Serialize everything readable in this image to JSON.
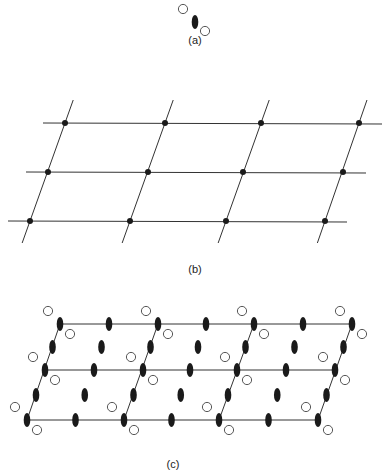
{
  "panels": {
    "a": {
      "label": "(a)",
      "label_pos": [
        195,
        34
      ]
    },
    "b": {
      "label": "(b)",
      "label_pos": [
        195,
        263
      ]
    },
    "c": {
      "label": "(c)",
      "label_pos": [
        173,
        458
      ]
    }
  },
  "colors": {
    "ink": "#1a1a1a",
    "line": "#333333",
    "bg": "#ffffff"
  },
  "motif": {
    "offsets": {
      "circle_ul": [
        -12,
        -13
      ],
      "circle_lr": [
        10,
        10
      ]
    },
    "ellipse_rx": 3.3,
    "ellipse_ry": 7,
    "circle_r": 4.6
  },
  "lattice_b": {
    "rows": [
      {
        "y": 123,
        "xs": [
          65,
          165,
          261,
          359
        ],
        "line": [
          43,
          382
        ]
      },
      {
        "y": 172,
        "xs": [
          48,
          148,
          243,
          343
        ],
        "line": [
          26,
          366
        ]
      },
      {
        "y": 221,
        "xs": [
          30,
          130,
          226,
          325
        ],
        "line": [
          8,
          347
        ]
      }
    ],
    "dot_r": 3
  },
  "lattice_c": {
    "rows": [
      {
        "y": 324,
        "xs": [
          60,
          158,
          254,
          352
        ]
      },
      {
        "y": 370,
        "xs": [
          45,
          143,
          237,
          335
        ]
      },
      {
        "y": 420,
        "xs": [
          27,
          124,
          219,
          318
        ]
      }
    ]
  }
}
